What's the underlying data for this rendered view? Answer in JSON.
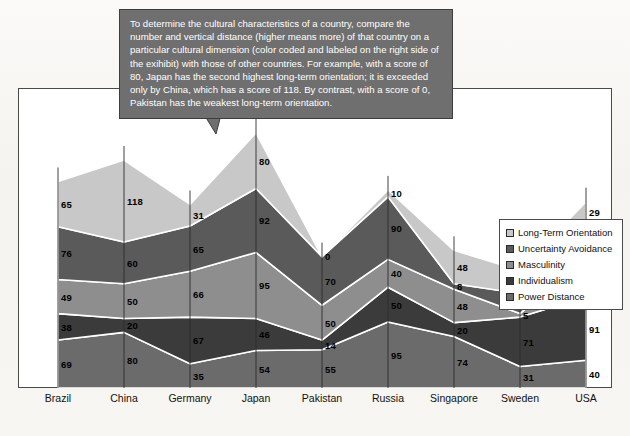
{
  "callout": {
    "text": "To determine the cultural characteristics of a country, compare the number and vertical distance (higher means more) of that country on a particular cultural dimension (color coded and labeled on the right side of the exihibit) with those of other countries.  For example, with a score of 80, Japan has the second highest long-term orientation; it is exceeded only by China, which has a score of 118.  By contrast, with a score of 0, Pakistan has the weakest long-term orientation."
  },
  "legend": {
    "position": "right",
    "items": [
      {
        "label": "Long-Term Orientation",
        "color": "#c8c8c8"
      },
      {
        "label": "Uncertainty Avoidance",
        "color": "#5a5a5a"
      },
      {
        "label": "Masculinity",
        "color": "#8e8e8e"
      },
      {
        "label": "Individualism",
        "color": "#3b3b3b"
      },
      {
        "label": "Power Distance",
        "color": "#6b6b6b"
      }
    ]
  },
  "chart_data": {
    "type": "area",
    "stacked": true,
    "title": "",
    "xlabel": "",
    "ylabel": "",
    "grid": false,
    "ylim": [
      0,
      420
    ],
    "categories": [
      "Brazil",
      "China",
      "Germany",
      "Japan",
      "Pakistan",
      "Russia",
      "Singapore",
      "Sweden",
      "USA"
    ],
    "stack_order_bottom_to_top": [
      "Power Distance",
      "Individualism",
      "Masculinity",
      "Uncertainty Avoidance",
      "Long-Term Orientation"
    ],
    "series": [
      {
        "name": "Power Distance",
        "color": "#6b6b6b",
        "values": [
          69,
          80,
          35,
          54,
          55,
          95,
          74,
          31,
          40
        ]
      },
      {
        "name": "Individualism",
        "color": "#3b3b3b",
        "values": [
          38,
          20,
          67,
          46,
          14,
          50,
          20,
          71,
          91
        ]
      },
      {
        "name": "Masculinity",
        "color": "#8e8e8e",
        "values": [
          49,
          50,
          66,
          95,
          50,
          40,
          48,
          5,
          62
        ]
      },
      {
        "name": "Uncertainty Avoidance",
        "color": "#5a5a5a",
        "values": [
          76,
          60,
          65,
          92,
          70,
          90,
          8,
          29,
          46
        ]
      },
      {
        "name": "Long-Term Orientation",
        "color": "#c8c8c8",
        "values": [
          65,
          118,
          31,
          80,
          0,
          10,
          48,
          33,
          29
        ]
      }
    ]
  }
}
